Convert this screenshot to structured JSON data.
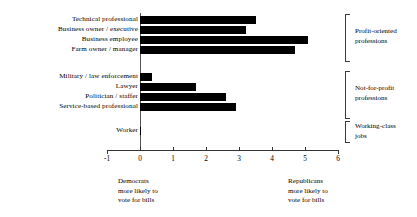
{
  "chart_data": {
    "type": "bar",
    "orientation": "horizontal",
    "title": "",
    "xlabel": "",
    "ylabel": "",
    "xlim": [
      -1,
      6
    ],
    "xticks": [
      "-1",
      "0",
      "1",
      "2",
      "3",
      "4",
      "5",
      "6"
    ],
    "grid": false,
    "legend": "none",
    "bar_color": "#000000",
    "categories": [
      "Technical professional",
      "Business owner / executive",
      "Business employee",
      "Farm owner / manager",
      "Military / law enforcement",
      "Lawyer",
      "Politician / staffer",
      "Service-based professional",
      "Worker"
    ],
    "values": [
      3.5,
      3.2,
      5.1,
      4.7,
      0.35,
      1.7,
      2.6,
      2.9,
      0.03
    ],
    "groups": [
      {
        "label": "Profit-oriented professions",
        "categories": [
          "Technical professional",
          "Business owner / executive",
          "Business employee",
          "Farm owner / manager"
        ]
      },
      {
        "label": "Not-for-profit professions",
        "categories": [
          "Military / law enforcement",
          "Lawyer",
          "Politician / staffer",
          "Service-based professional"
        ]
      },
      {
        "label": "Working-class jobs",
        "categories": [
          "Worker"
        ]
      }
    ],
    "annotations": [
      {
        "position": "bottom-left",
        "lines": [
          "Democrats",
          "more likely to",
          "vote for bills"
        ]
      },
      {
        "position": "bottom-right",
        "lines": [
          "Republicans",
          "more likely to",
          "vote for bills"
        ]
      }
    ]
  },
  "axis": {
    "ticks": [
      {
        "label": "-1",
        "value": -1
      },
      {
        "label": "0",
        "value": 0
      },
      {
        "label": "1",
        "value": 1
      },
      {
        "label": "2",
        "value": 2
      },
      {
        "label": "3",
        "value": 3
      },
      {
        "label": "4",
        "value": 4
      },
      {
        "label": "5",
        "value": 5
      },
      {
        "label": "6",
        "value": 6
      }
    ]
  },
  "labels": {
    "cat0": "Technical professional",
    "cat1": "Business owner / executive",
    "cat2": "Business employee",
    "cat3": "Farm owner / manager",
    "cat4": "Military / law enforcement",
    "cat5": "Lawyer",
    "cat6": "Politician / staffer",
    "cat7": "Service-based professional",
    "cat8": "Worker"
  },
  "groups": {
    "g0_line1": "Profit-oriented",
    "g0_line2": "professions",
    "g1_line1": "Not-for-profit",
    "g1_line2": "professions",
    "g2_line1": "Working-class",
    "g2_line2": "jobs"
  },
  "annotations": {
    "left_line1": "Democrats",
    "left_line2": "more likely to",
    "left_line3": "vote for bills",
    "right_line1": "Republicans",
    "right_line2": "more likely to",
    "right_line3": "vote for bills"
  }
}
